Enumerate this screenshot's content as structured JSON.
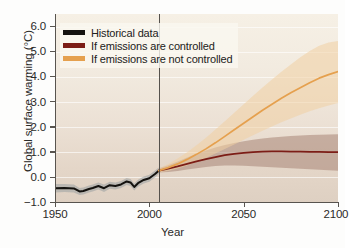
{
  "chart_data": {
    "type": "line",
    "title": "",
    "xlabel": "Year",
    "ylabel": "Global surface warming (°C)",
    "xlim": [
      1950,
      2100
    ],
    "ylim": [
      -1.0,
      6.5
    ],
    "xticks": [
      1950,
      2000,
      2050,
      2100
    ],
    "yticks": [
      -1.0,
      0.0,
      1.0,
      2.0,
      3.0,
      4.0,
      5.0,
      6.0
    ],
    "ytick_labels": [
      "−1.0",
      "0.0",
      "1.0",
      "2.0",
      "3.0",
      "4.0",
      "5.0",
      "6.0"
    ],
    "xtick_labels": [
      "1950",
      "2000",
      "2050",
      "2100"
    ],
    "grid": "horizontal-faint-white",
    "legend_position": "top-left",
    "annotations": [
      {
        "name": "present-day-divider",
        "type": "vline",
        "x": 2005
      }
    ],
    "series": [
      {
        "name": "Historical data",
        "color": "#14120f",
        "band_color": "#9aa0a2",
        "x": [
          1950,
          1955,
          1960,
          1963,
          1965,
          1968,
          1970,
          1973,
          1976,
          1979,
          1982,
          1985,
          1988,
          1990,
          1992,
          1994,
          1997,
          2000,
          2003,
          2005
        ],
        "values": [
          -0.45,
          -0.44,
          -0.46,
          -0.58,
          -0.56,
          -0.48,
          -0.44,
          -0.36,
          -0.45,
          -0.33,
          -0.36,
          -0.3,
          -0.18,
          -0.22,
          -0.4,
          -0.25,
          -0.12,
          -0.05,
          0.12,
          0.25
        ],
        "band_low": [
          -0.62,
          -0.6,
          -0.62,
          -0.72,
          -0.7,
          -0.62,
          -0.58,
          -0.5,
          -0.6,
          -0.47,
          -0.5,
          -0.44,
          -0.32,
          -0.36,
          -0.54,
          -0.39,
          -0.26,
          -0.19,
          -0.02,
          0.12
        ],
        "band_high": [
          -0.28,
          -0.28,
          -0.3,
          -0.44,
          -0.42,
          -0.34,
          -0.3,
          -0.22,
          -0.3,
          -0.19,
          -0.22,
          -0.16,
          -0.04,
          -0.08,
          -0.26,
          -0.11,
          0.02,
          0.09,
          0.26,
          0.38
        ]
      },
      {
        "name": "If emissions are controlled",
        "color": "#7c1d16",
        "band_color": "#a78577",
        "x": [
          2005,
          2010,
          2015,
          2020,
          2025,
          2030,
          2035,
          2040,
          2045,
          2050,
          2055,
          2060,
          2065,
          2070,
          2075,
          2080,
          2085,
          2090,
          2095,
          2100
        ],
        "values": [
          0.25,
          0.33,
          0.42,
          0.52,
          0.62,
          0.71,
          0.79,
          0.87,
          0.92,
          0.96,
          0.99,
          1.01,
          1.02,
          1.02,
          1.01,
          1.01,
          1.0,
          1.0,
          0.99,
          0.99
        ],
        "band_low": [
          0.18,
          0.2,
          0.24,
          0.3,
          0.35,
          0.4,
          0.44,
          0.46,
          0.46,
          0.45,
          0.43,
          0.41,
          0.39,
          0.37,
          0.35,
          0.33,
          0.31,
          0.29,
          0.27,
          0.25
        ],
        "band_high": [
          0.34,
          0.47,
          0.62,
          0.78,
          0.92,
          1.05,
          1.17,
          1.27,
          1.35,
          1.42,
          1.48,
          1.53,
          1.57,
          1.6,
          1.63,
          1.65,
          1.67,
          1.68,
          1.69,
          1.7
        ]
      },
      {
        "name": "If emissions are not controlled",
        "color": "#e5a04e",
        "band_color": "#f0cfa3",
        "x": [
          2005,
          2010,
          2015,
          2020,
          2025,
          2030,
          2035,
          2040,
          2045,
          2050,
          2055,
          2060,
          2065,
          2070,
          2075,
          2080,
          2085,
          2090,
          2095,
          2100
        ],
        "values": [
          0.25,
          0.37,
          0.52,
          0.7,
          0.9,
          1.12,
          1.36,
          1.62,
          1.88,
          2.14,
          2.4,
          2.66,
          2.9,
          3.14,
          3.36,
          3.56,
          3.76,
          3.94,
          4.08,
          4.2
        ],
        "band_low": [
          0.18,
          0.24,
          0.34,
          0.46,
          0.6,
          0.76,
          0.93,
          1.11,
          1.29,
          1.48,
          1.66,
          1.84,
          2.01,
          2.18,
          2.33,
          2.48,
          2.62,
          2.74,
          2.85,
          2.95
        ],
        "band_high": [
          0.34,
          0.52,
          0.74,
          0.98,
          1.26,
          1.56,
          1.89,
          2.22,
          2.56,
          2.9,
          3.24,
          3.57,
          3.89,
          4.2,
          4.49,
          4.77,
          5.02,
          5.23,
          5.36,
          5.42
        ]
      }
    ]
  },
  "legend": {
    "items": [
      {
        "label": "Historical data",
        "color": "#14120f"
      },
      {
        "label": "If emissions are controlled",
        "color": "#7c1d16"
      },
      {
        "label": "If emissions are not controlled",
        "color": "#e5a04e"
      }
    ]
  },
  "axes": {
    "x_title": "Year",
    "y_title_main": "Global surface warming (",
    "y_title_unit": "°C",
    "y_title_end": ")",
    "x_tick_labels": [
      "1950",
      "2000",
      "2050",
      "2100"
    ],
    "y_tick_labels": [
      "6.0",
      "5.0",
      "4.0",
      "3.0",
      "2.0",
      "1.0",
      "0.0",
      "−1.0"
    ]
  }
}
